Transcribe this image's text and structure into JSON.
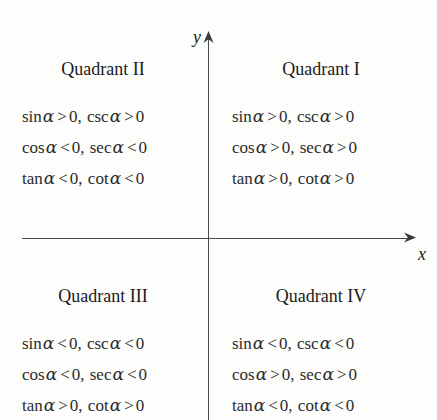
{
  "figure": {
    "type": "quadrant-sign-chart",
    "background_color": "#fdfdfb",
    "line_color": "#4a4a4a",
    "text_color": "#1a1a1a"
  },
  "axes": {
    "x_label": "x",
    "y_label": "y",
    "x_arrow": "right-arrow",
    "y_arrow": "up-arrow"
  },
  "symbols": {
    "alpha": "α",
    "greater": ">",
    "less": "<",
    "zero": "0",
    "comma": ","
  },
  "quadrants": [
    {
      "id": "quadrant-1",
      "title": "Quadrant I",
      "position": "top-right",
      "lines": [
        {
          "terms": [
            {
              "fn": "sin",
              "rel": ">",
              "value": "0"
            },
            {
              "fn": "csc",
              "rel": ">",
              "value": "0"
            }
          ]
        },
        {
          "terms": [
            {
              "fn": "cos",
              "rel": ">",
              "value": "0"
            },
            {
              "fn": "sec",
              "rel": ">",
              "value": "0"
            }
          ]
        },
        {
          "terms": [
            {
              "fn": "tan",
              "rel": ">",
              "value": "0"
            },
            {
              "fn": "cot",
              "rel": ">",
              "value": "0"
            }
          ]
        }
      ]
    },
    {
      "id": "quadrant-2",
      "title": "Quadrant II",
      "position": "top-left",
      "lines": [
        {
          "terms": [
            {
              "fn": "sin",
              "rel": ">",
              "value": "0"
            },
            {
              "fn": "csc",
              "rel": ">",
              "value": "0"
            }
          ]
        },
        {
          "terms": [
            {
              "fn": "cos",
              "rel": "<",
              "value": "0"
            },
            {
              "fn": "sec",
              "rel": "<",
              "value": "0"
            }
          ]
        },
        {
          "terms": [
            {
              "fn": "tan",
              "rel": "<",
              "value": "0"
            },
            {
              "fn": "cot",
              "rel": "<",
              "value": "0"
            }
          ]
        }
      ]
    },
    {
      "id": "quadrant-3",
      "title": "Quadrant III",
      "position": "bottom-left",
      "lines": [
        {
          "terms": [
            {
              "fn": "sin",
              "rel": "<",
              "value": "0"
            },
            {
              "fn": "csc",
              "rel": "<",
              "value": "0"
            }
          ]
        },
        {
          "terms": [
            {
              "fn": "cos",
              "rel": "<",
              "value": "0"
            },
            {
              "fn": "sec",
              "rel": "<",
              "value": "0"
            }
          ]
        },
        {
          "terms": [
            {
              "fn": "tan",
              "rel": ">",
              "value": "0"
            },
            {
              "fn": "cot",
              "rel": ">",
              "value": "0"
            }
          ]
        }
      ]
    },
    {
      "id": "quadrant-4",
      "title": "Quadrant IV",
      "position": "bottom-right",
      "lines": [
        {
          "terms": [
            {
              "fn": "sin",
              "rel": "<",
              "value": "0"
            },
            {
              "fn": "csc",
              "rel": "<",
              "value": "0"
            }
          ]
        },
        {
          "terms": [
            {
              "fn": "cos",
              "rel": ">",
              "value": "0"
            },
            {
              "fn": "sec",
              "rel": ">",
              "value": "0"
            }
          ]
        },
        {
          "terms": [
            {
              "fn": "tan",
              "rel": "<",
              "value": "0"
            },
            {
              "fn": "cot",
              "rel": "<",
              "value": "0"
            }
          ]
        }
      ]
    }
  ]
}
